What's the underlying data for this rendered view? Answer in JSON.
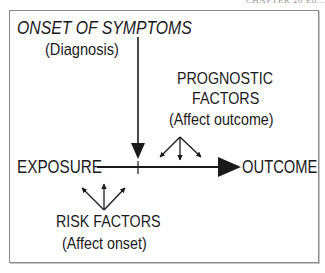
{
  "header": {
    "partial_text": "CHAPTER 20 Ep..."
  },
  "diagram": {
    "onset": {
      "title": "ONSET OF SYMPTOMS",
      "subtitle": "(Diagnosis)"
    },
    "prognostic": {
      "line1": "PROGNOSTIC",
      "line2": "FACTORS",
      "subtitle": "(Affect outcome)"
    },
    "exposure": "EXPOSURE",
    "outcome": "OUTCOME",
    "risk": {
      "title": "RISK FACTORS",
      "subtitle": "(Affect onset)"
    },
    "colors": {
      "ink": "#1a1a1a",
      "frame": "#8a8a8a",
      "background": "#ffffff"
    }
  }
}
